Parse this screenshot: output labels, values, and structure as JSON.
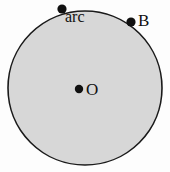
{
  "figure": {
    "type": "geometry-diagram",
    "background_color": "#fdfdfd",
    "circle": {
      "name": "main-circle",
      "center_x": 85,
      "center_y": 88,
      "radius": 77,
      "fill_color": "#d7d7d7",
      "stroke_color": "#1a1a1a",
      "stroke_width": 1.6
    },
    "points": [
      {
        "id": "center",
        "name": "point-o",
        "label": "O",
        "x": 79,
        "y": 89,
        "dot_radius": 4.2,
        "dot_color": "#101010",
        "label_position": "right"
      },
      {
        "id": "arc",
        "name": "point-arc",
        "label": "arc",
        "x": 62,
        "y": 9,
        "dot_radius": 4.6,
        "dot_color": "#101010",
        "label_position": "below-right"
      },
      {
        "id": "b",
        "name": "point-b",
        "label": "B",
        "x": 131,
        "y": 22,
        "dot_radius": 4.6,
        "dot_color": "#101010",
        "label_position": "right"
      }
    ]
  }
}
